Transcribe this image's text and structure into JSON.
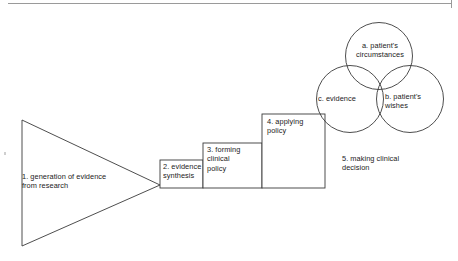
{
  "figure": {
    "background_color": "#ffffff",
    "stroke_color": "#3a3a3a",
    "text_color": "#1b1b1b"
  },
  "stages": {
    "triangle": {
      "label": "1. generation of evidence\nfrom research",
      "shape": "triangle",
      "number": "1"
    },
    "box2": {
      "label": "2. evidence\nsynthesis",
      "shape": "rectangle",
      "number": "2"
    },
    "box3": {
      "label": "3. forming\nclinical\npolicy",
      "shape": "rectangle",
      "number": "3"
    },
    "box4": {
      "label": "4. applying\npolicy",
      "shape": "rectangle",
      "number": "4"
    }
  },
  "venn": {
    "caption": "5. making clinical\ndecision",
    "number": "5",
    "circles": [
      {
        "key": "a",
        "label": "a. patient's\ncircumstances",
        "position": "top"
      },
      {
        "key": "c",
        "label": "c. evidence",
        "position": "left"
      },
      {
        "key": "b",
        "label": "b. patient's\nwishes",
        "position": "right"
      }
    ]
  }
}
